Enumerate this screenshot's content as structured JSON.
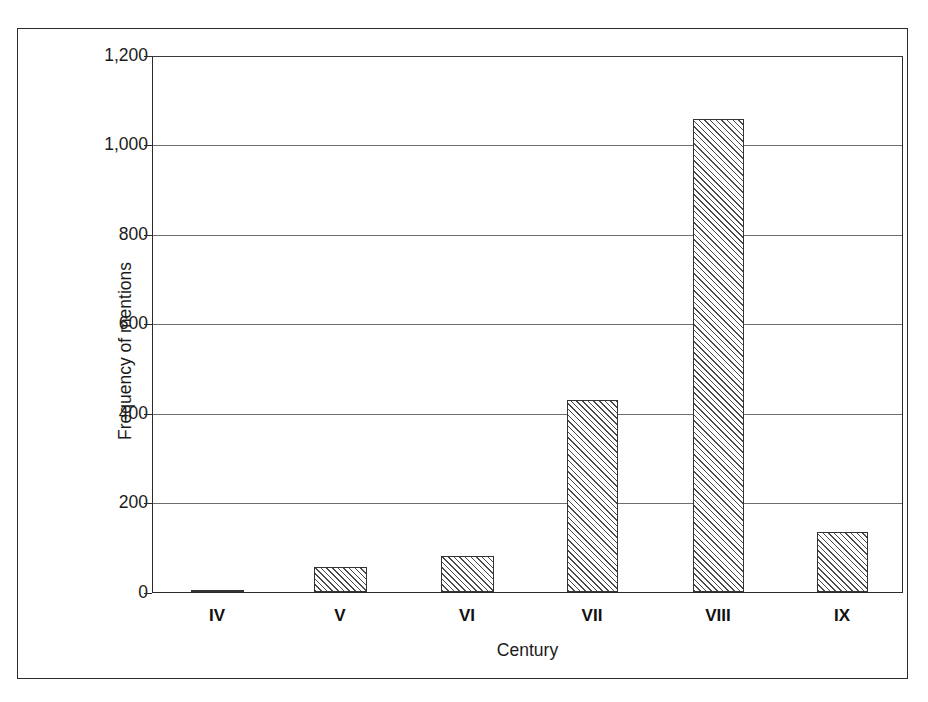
{
  "chart_data": {
    "type": "bar",
    "title": "",
    "subtitle": "",
    "xlabel": "Century",
    "ylabel": "Frequency of mentions",
    "categories": [
      "IV",
      "V",
      "VI",
      "VII",
      "VIII",
      "IX"
    ],
    "values": [
      5,
      55,
      80,
      430,
      1060,
      135
    ],
    "series": [
      {
        "name": "Frequency of mentions",
        "values": [
          5,
          55,
          80,
          430,
          1060,
          135
        ]
      }
    ],
    "ylim": [
      0,
      1200
    ],
    "ytick_values": [
      0,
      200,
      400,
      600,
      800,
      1000,
      1200
    ],
    "ytick_labels": [
      "0",
      "200",
      "400",
      "600",
      "800",
      "1,000",
      "1,200"
    ],
    "grid": true,
    "grid_axis": "y",
    "legend": false,
    "legend_position": "none",
    "bar_fill": "diagonal-hatch",
    "bar_edge_color": "#333333",
    "frame": true
  },
  "axes": {
    "y_title": "Frequency of mentions",
    "x_title": "Century",
    "y_labels": [
      "1,200",
      "1,000",
      "800",
      "600",
      "400",
      "200",
      "0"
    ],
    "x_labels": [
      "IV",
      "V",
      "VI",
      "VII",
      "VIII",
      "IX"
    ]
  },
  "colors": {
    "frame": "#2b2b2b",
    "gridline": "#6e6e6e",
    "hatch": "#4a4a4a",
    "background": "#ffffff",
    "text": "#1b1b1b"
  }
}
